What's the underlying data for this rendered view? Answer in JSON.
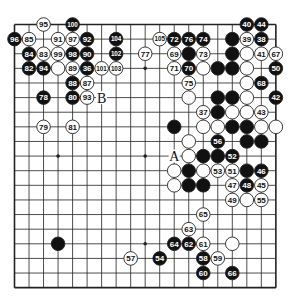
{
  "diagram": {
    "type": "go-board",
    "size": 19,
    "geometry": {
      "left": 14.5,
      "top": 24.5,
      "spacing_x": 14.52,
      "spacing_y": 14.62,
      "stone_radius": 6.8
    },
    "colors": {
      "line": "#222222",
      "black_stone": "#111111",
      "white_stone": "#ffffff",
      "stone_outline": "#222222",
      "label_on_black": "#ffffff",
      "label_on_white": "#111111"
    },
    "star_points": [
      [
        3,
        3
      ],
      [
        9,
        3
      ],
      [
        15,
        3
      ],
      [
        3,
        9
      ],
      [
        9,
        9
      ],
      [
        15,
        9
      ],
      [
        3,
        15
      ],
      [
        9,
        15
      ],
      [
        15,
        15
      ]
    ],
    "stones": [
      {
        "x": 2,
        "y": 0,
        "c": "W",
        "n": "95"
      },
      {
        "x": 4,
        "y": 0,
        "c": "B",
        "n": "100"
      },
      {
        "x": 16,
        "y": 0,
        "c": "B",
        "n": "40"
      },
      {
        "x": 17,
        "y": 0,
        "c": "B",
        "n": "44"
      },
      {
        "x": 0,
        "y": 1,
        "c": "B",
        "n": "96"
      },
      {
        "x": 1,
        "y": 1,
        "c": "W",
        "n": "85"
      },
      {
        "x": 3,
        "y": 1,
        "c": "W",
        "n": "91"
      },
      {
        "x": 4,
        "y": 1,
        "c": "W",
        "n": "97"
      },
      {
        "x": 5,
        "y": 1,
        "c": "B",
        "n": "92"
      },
      {
        "x": 7,
        "y": 1,
        "c": "B",
        "n": "104"
      },
      {
        "x": 10,
        "y": 1,
        "c": "W",
        "n": "105"
      },
      {
        "x": 11,
        "y": 1,
        "c": "B",
        "n": "72"
      },
      {
        "x": 12,
        "y": 1,
        "c": "B",
        "n": "76"
      },
      {
        "x": 13,
        "y": 1,
        "c": "B",
        "n": "74"
      },
      {
        "x": 15,
        "y": 1,
        "c": "B",
        "n": ""
      },
      {
        "x": 16,
        "y": 1,
        "c": "W",
        "n": "39"
      },
      {
        "x": 17,
        "y": 1,
        "c": "B",
        "n": "38"
      },
      {
        "x": 1,
        "y": 2,
        "c": "B",
        "n": "84"
      },
      {
        "x": 2,
        "y": 2,
        "c": "W",
        "n": "83"
      },
      {
        "x": 3,
        "y": 2,
        "c": "W",
        "n": "99"
      },
      {
        "x": 4,
        "y": 2,
        "c": "B",
        "n": "98"
      },
      {
        "x": 5,
        "y": 2,
        "c": "B",
        "n": "90"
      },
      {
        "x": 7,
        "y": 2,
        "c": "B",
        "n": "102"
      },
      {
        "x": 9,
        "y": 2,
        "c": "W",
        "n": "77"
      },
      {
        "x": 11,
        "y": 2,
        "c": "W",
        "n": "69"
      },
      {
        "x": 12,
        "y": 2,
        "c": "B",
        "n": ""
      },
      {
        "x": 13,
        "y": 2,
        "c": "W",
        "n": "73"
      },
      {
        "x": 15,
        "y": 2,
        "c": "B",
        "n": ""
      },
      {
        "x": 16,
        "y": 2,
        "c": "W",
        "n": ""
      },
      {
        "x": 17,
        "y": 2,
        "c": "W",
        "n": "41"
      },
      {
        "x": 18,
        "y": 2,
        "c": "W",
        "n": "67"
      },
      {
        "x": 1,
        "y": 3,
        "c": "B",
        "n": "82"
      },
      {
        "x": 2,
        "y": 3,
        "c": "B",
        "n": "94"
      },
      {
        "x": 3,
        "y": 3,
        "c": "W",
        "n": ""
      },
      {
        "x": 4,
        "y": 3,
        "c": "W",
        "n": "89"
      },
      {
        "x": 5,
        "y": 3,
        "c": "B",
        "n": "36"
      },
      {
        "x": 6,
        "y": 3,
        "c": "W",
        "n": "101"
      },
      {
        "x": 7,
        "y": 3,
        "c": "W",
        "n": "103"
      },
      {
        "x": 11,
        "y": 3,
        "c": "W",
        "n": "71"
      },
      {
        "x": 12,
        "y": 3,
        "c": "B",
        "n": "70"
      },
      {
        "x": 13,
        "y": 3,
        "c": "W",
        "n": ""
      },
      {
        "x": 14,
        "y": 3,
        "c": "B",
        "n": ""
      },
      {
        "x": 15,
        "y": 3,
        "c": "B",
        "n": ""
      },
      {
        "x": 16,
        "y": 3,
        "c": "W",
        "n": ""
      },
      {
        "x": 18,
        "y": 3,
        "c": "B",
        "n": "50"
      },
      {
        "x": 4,
        "y": 4,
        "c": "B",
        "n": "88"
      },
      {
        "x": 5,
        "y": 4,
        "c": "W",
        "n": "87"
      },
      {
        "x": 12,
        "y": 4,
        "c": "W",
        "n": "75"
      },
      {
        "x": 16,
        "y": 4,
        "c": "W",
        "n": ""
      },
      {
        "x": 17,
        "y": 4,
        "c": "B",
        "n": "68"
      },
      {
        "x": 2,
        "y": 5,
        "c": "B",
        "n": "78"
      },
      {
        "x": 4,
        "y": 5,
        "c": "B",
        "n": "80"
      },
      {
        "x": 5,
        "y": 5,
        "c": "W",
        "n": "93"
      },
      {
        "x": 12,
        "y": 5,
        "c": "W",
        "n": ""
      },
      {
        "x": 14,
        "y": 5,
        "c": "B",
        "n": ""
      },
      {
        "x": 15,
        "y": 5,
        "c": "B",
        "n": ""
      },
      {
        "x": 16,
        "y": 5,
        "c": "W",
        "n": ""
      },
      {
        "x": 18,
        "y": 5,
        "c": "B",
        "n": "42"
      },
      {
        "x": 13,
        "y": 6,
        "c": "W",
        "n": "37"
      },
      {
        "x": 14,
        "y": 6,
        "c": "B",
        "n": ""
      },
      {
        "x": 15,
        "y": 6,
        "c": "W",
        "n": ""
      },
      {
        "x": 16,
        "y": 6,
        "c": "W",
        "n": ""
      },
      {
        "x": 17,
        "y": 6,
        "c": "W",
        "n": "43"
      },
      {
        "x": 2,
        "y": 7,
        "c": "W",
        "n": "79"
      },
      {
        "x": 4,
        "y": 7,
        "c": "W",
        "n": "81"
      },
      {
        "x": 11,
        "y": 7,
        "c": "B",
        "n": ""
      },
      {
        "x": 13,
        "y": 7,
        "c": "W",
        "n": ""
      },
      {
        "x": 14,
        "y": 7,
        "c": "W",
        "n": ""
      },
      {
        "x": 15,
        "y": 7,
        "c": "B",
        "n": ""
      },
      {
        "x": 16,
        "y": 7,
        "c": "B",
        "n": ""
      },
      {
        "x": 17,
        "y": 7,
        "c": "W",
        "n": ""
      },
      {
        "x": 18,
        "y": 7,
        "c": "W",
        "n": ""
      },
      {
        "x": 12,
        "y": 8,
        "c": "W",
        "n": ""
      },
      {
        "x": 14,
        "y": 8,
        "c": "B",
        "n": "56"
      },
      {
        "x": 16,
        "y": 8,
        "c": "B",
        "n": ""
      },
      {
        "x": 17,
        "y": 8,
        "c": "B",
        "n": ""
      },
      {
        "x": 12,
        "y": 9,
        "c": "W",
        "n": ""
      },
      {
        "x": 13,
        "y": 9,
        "c": "B",
        "n": ""
      },
      {
        "x": 14,
        "y": 9,
        "c": "B",
        "n": ""
      },
      {
        "x": 15,
        "y": 9,
        "c": "B",
        "n": "52"
      },
      {
        "x": 11,
        "y": 10,
        "c": "W",
        "n": ""
      },
      {
        "x": 12,
        "y": 10,
        "c": "B",
        "n": ""
      },
      {
        "x": 13,
        "y": 10,
        "c": "W",
        "n": ""
      },
      {
        "x": 14,
        "y": 10,
        "c": "W",
        "n": "53"
      },
      {
        "x": 15,
        "y": 10,
        "c": "W",
        "n": "51"
      },
      {
        "x": 16,
        "y": 10,
        "c": "B",
        "n": ""
      },
      {
        "x": 17,
        "y": 10,
        "c": "B",
        "n": "46"
      },
      {
        "x": 11,
        "y": 11,
        "c": "W",
        "n": ""
      },
      {
        "x": 12,
        "y": 11,
        "c": "B",
        "n": ""
      },
      {
        "x": 13,
        "y": 11,
        "c": "B",
        "n": ""
      },
      {
        "x": 15,
        "y": 11,
        "c": "W",
        "n": "47"
      },
      {
        "x": 16,
        "y": 11,
        "c": "B",
        "n": "48"
      },
      {
        "x": 17,
        "y": 11,
        "c": "W",
        "n": "45"
      },
      {
        "x": 15,
        "y": 12,
        "c": "W",
        "n": "49"
      },
      {
        "x": 16,
        "y": 12,
        "c": "W",
        "n": ""
      },
      {
        "x": 17,
        "y": 12,
        "c": "W",
        "n": "55"
      },
      {
        "x": 13,
        "y": 13,
        "c": "W",
        "n": "65"
      },
      {
        "x": 12,
        "y": 14,
        "c": "W",
        "n": "63"
      },
      {
        "x": 3,
        "y": 15,
        "c": "B",
        "n": ""
      },
      {
        "x": 11,
        "y": 15,
        "c": "B",
        "n": "64"
      },
      {
        "x": 12,
        "y": 15,
        "c": "B",
        "n": "62"
      },
      {
        "x": 13,
        "y": 15,
        "c": "W",
        "n": "61"
      },
      {
        "x": 15,
        "y": 15,
        "c": "W",
        "n": ""
      },
      {
        "x": 8,
        "y": 16,
        "c": "W",
        "n": "57"
      },
      {
        "x": 10,
        "y": 16,
        "c": "B",
        "n": "54"
      },
      {
        "x": 13,
        "y": 16,
        "c": "B",
        "n": "58"
      },
      {
        "x": 14,
        "y": 16,
        "c": "W",
        "n": "59"
      },
      {
        "x": 13,
        "y": 17,
        "c": "B",
        "n": "60"
      },
      {
        "x": 15,
        "y": 17,
        "c": "B",
        "n": "66"
      }
    ],
    "point_labels": [
      {
        "x": 11,
        "y": 9,
        "text": "A"
      },
      {
        "x": 6,
        "y": 5,
        "text": "B"
      }
    ]
  }
}
